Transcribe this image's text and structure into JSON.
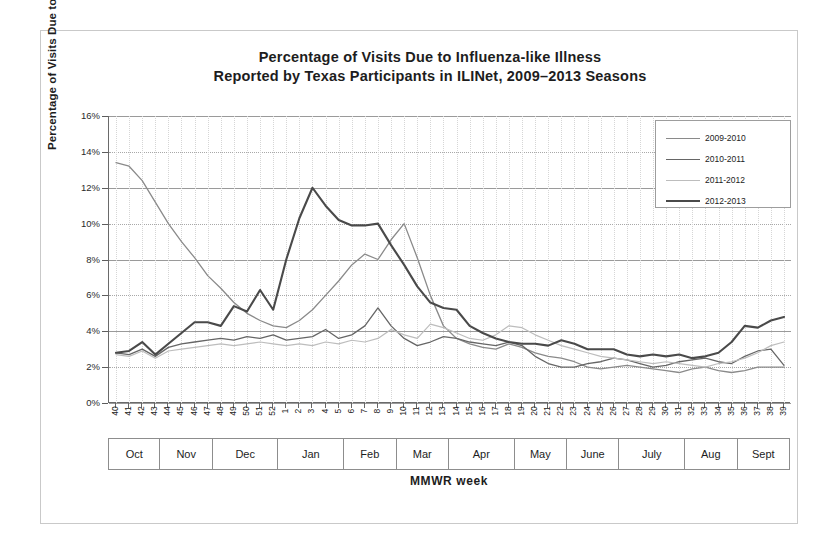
{
  "chart_data": {
    "type": "line",
    "title": "Percentage of Visits Due to Influenza-like Illness",
    "subtitle": "Reported by Texas Participants in ILINet, 2009–2013 Seasons",
    "xlabel": "MMWR week",
    "ylabel": "Percentage of Visits Due to ILI",
    "ylim": [
      0,
      16
    ],
    "ytick_labels": [
      "0%",
      "2%",
      "4%",
      "6%",
      "8%",
      "10%",
      "12%",
      "14%",
      "16%"
    ],
    "ytick_values": [
      0,
      2,
      4,
      6,
      8,
      10,
      12,
      14,
      16
    ],
    "grid": true,
    "legend_position": "top-right",
    "x": [
      40,
      41,
      42,
      43,
      44,
      45,
      46,
      47,
      48,
      49,
      50,
      51,
      52,
      1,
      2,
      3,
      4,
      5,
      6,
      7,
      8,
      9,
      10,
      11,
      12,
      13,
      14,
      15,
      16,
      17,
      18,
      19,
      20,
      21,
      22,
      23,
      24,
      25,
      26,
      27,
      28,
      29,
      30,
      31,
      32,
      33,
      34,
      35,
      36,
      37,
      38,
      39
    ],
    "months": [
      {
        "label": "Oct",
        "weeks": 4
      },
      {
        "label": "Nov",
        "weeks": 4
      },
      {
        "label": "Dec",
        "weeks": 5
      },
      {
        "label": "Jan",
        "weeks": 5
      },
      {
        "label": "Feb",
        "weeks": 4
      },
      {
        "label": "Mar",
        "weeks": 4
      },
      {
        "label": "Apr",
        "weeks": 5
      },
      {
        "label": "May",
        "weeks": 4
      },
      {
        "label": "June",
        "weeks": 4
      },
      {
        "label": "July",
        "weeks": 5
      },
      {
        "label": "Aug",
        "weeks": 4
      },
      {
        "label": "Sept",
        "weeks": 4
      }
    ],
    "series": [
      {
        "name": "2009-2010",
        "color": "#8a8a8a",
        "width": 1.3,
        "values": [
          13.4,
          13.2,
          12.4,
          11.2,
          10.0,
          9.0,
          8.1,
          7.1,
          6.4,
          5.6,
          5.0,
          4.6,
          4.3,
          4.2,
          4.6,
          5.2,
          6.0,
          6.8,
          7.7,
          8.3,
          8.0,
          9.1,
          10.0,
          8.1,
          6.0,
          4.3,
          3.6,
          3.3,
          3.1,
          3.0,
          3.3,
          3.1,
          2.8,
          2.6,
          2.5,
          2.3,
          2.0,
          1.9,
          2.0,
          2.1,
          2.0,
          1.9,
          1.8,
          1.7,
          1.9,
          2.0,
          1.8,
          1.7,
          1.8,
          2.0,
          2.0,
          2.0
        ]
      },
      {
        "name": "2010-2011",
        "color": "#666666",
        "width": 1.3,
        "values": [
          2.8,
          2.7,
          3.0,
          2.6,
          3.1,
          3.3,
          3.4,
          3.5,
          3.6,
          3.5,
          3.7,
          3.6,
          3.8,
          3.5,
          3.6,
          3.7,
          4.1,
          3.6,
          3.8,
          4.3,
          5.3,
          4.3,
          3.6,
          3.2,
          3.4,
          3.7,
          3.6,
          3.4,
          3.3,
          3.2,
          3.4,
          3.2,
          2.6,
          2.2,
          2.0,
          2.0,
          2.2,
          2.3,
          2.5,
          2.4,
          2.2,
          2.0,
          2.1,
          2.3,
          2.4,
          2.5,
          2.3,
          2.2,
          2.6,
          2.9,
          3.0,
          2.1
        ]
      },
      {
        "name": "2011-2012",
        "color": "#bdbdbd",
        "width": 1.2,
        "values": [
          2.7,
          2.6,
          2.9,
          2.5,
          2.9,
          3.0,
          3.1,
          3.2,
          3.3,
          3.2,
          3.3,
          3.4,
          3.3,
          3.2,
          3.3,
          3.2,
          3.4,
          3.3,
          3.5,
          3.4,
          3.6,
          4.1,
          3.8,
          3.6,
          4.4,
          4.2,
          3.9,
          3.6,
          3.5,
          3.8,
          4.3,
          4.2,
          3.8,
          3.5,
          3.2,
          3.0,
          2.8,
          2.6,
          2.5,
          2.4,
          2.3,
          2.2,
          2.3,
          2.2,
          2.1,
          2.0,
          2.2,
          2.3,
          2.5,
          2.8,
          3.2,
          3.4
        ]
      },
      {
        "name": "2012-2013",
        "color": "#4a4a4a",
        "width": 2.1,
        "values": [
          2.8,
          2.9,
          3.4,
          2.7,
          3.3,
          3.9,
          4.5,
          4.5,
          4.3,
          5.4,
          5.1,
          6.3,
          5.2,
          8.0,
          10.3,
          12.0,
          11.0,
          10.2,
          9.9,
          9.9,
          10.0,
          8.8,
          7.7,
          6.5,
          5.6,
          5.3,
          5.2,
          4.3,
          3.9,
          3.6,
          3.4,
          3.3,
          3.3,
          3.2,
          3.5,
          3.3,
          3.0,
          3.0,
          3.0,
          2.7,
          2.6,
          2.7,
          2.6,
          2.7,
          2.5,
          2.6,
          2.8,
          3.4,
          4.3,
          4.2,
          4.6,
          4.8
        ]
      }
    ]
  }
}
